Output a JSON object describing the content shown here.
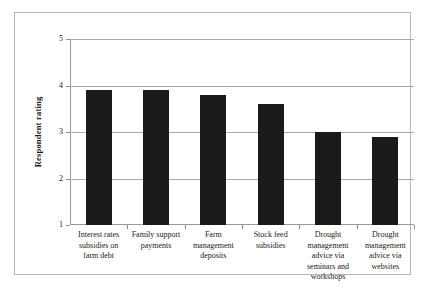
{
  "chart_data": {
    "type": "bar",
    "title": "",
    "xlabel": "",
    "ylabel": "Respondent rating",
    "categories": [
      "Interest rates subsidies on farm debt",
      "Family support payments",
      "Farm management deposits",
      "Stock feed subsidies",
      "Drought management advice via seminars and workshops",
      "Drought management advice via websites"
    ],
    "category_lines": [
      [
        "Interest rates",
        "subsidies on",
        "farm debt"
      ],
      [
        "Family support",
        "payments"
      ],
      [
        "Farm",
        "management",
        "deposits"
      ],
      [
        "Stock feed",
        "subsidies"
      ],
      [
        "Drought",
        "management",
        "advice via",
        "seminars and",
        "workshops"
      ],
      [
        "Drought",
        "management",
        "advice via",
        "websites"
      ]
    ],
    "values": [
      3.9,
      3.9,
      3.8,
      3.6,
      3.0,
      2.9
    ],
    "ylim": [
      1,
      5
    ],
    "yticks": [
      1,
      2,
      3,
      4,
      5
    ],
    "ytick_labels": [
      "1",
      "2",
      "3",
      "4",
      "5"
    ],
    "grid": true,
    "legend": "none",
    "bar_color": "#1a1a1a",
    "gridline_color": "#a9a9a9",
    "axis_color": "#9a9a9a",
    "border_color": "#b8b8b8",
    "background": "#ffffff"
  }
}
